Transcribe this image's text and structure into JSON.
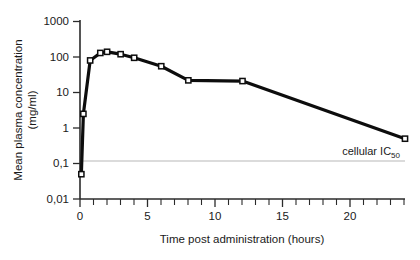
{
  "chart_data": {
    "type": "line",
    "title": "",
    "xlabel": "Time post administration (hours)",
    "ylabel_line1": "Mean plasma concentration",
    "ylabel_line2": "(mg/ml)",
    "yscale": "log",
    "xlim": [
      0,
      24
    ],
    "ylim": [
      0.01,
      1000
    ],
    "grid": false,
    "legend": "none",
    "x_ticklabels": [
      "0",
      "5",
      "10",
      "15",
      "20"
    ],
    "x_tickvalues": [
      0,
      5,
      10,
      15,
      20
    ],
    "x_minor_step": 1,
    "y_ticklabels": [
      "1000",
      "100",
      "10",
      "1",
      "0,1",
      "0,01"
    ],
    "y_tickvalues": [
      1000,
      100,
      10,
      1,
      0.1,
      0.01
    ],
    "x": [
      0.1,
      0.25,
      0.75,
      1.5,
      2,
      3,
      4,
      6,
      8,
      12,
      24
    ],
    "values": [
      0.05,
      2.5,
      80,
      130,
      140,
      120,
      95,
      55,
      22,
      21,
      0.5
    ],
    "marker": "open-square",
    "annotations": [
      {
        "name": "cellular-ic50",
        "text": "cellular IC",
        "subscript": "50",
        "y_value": 0.1,
        "line_from_x": 0,
        "line_to_x": 24
      }
    ]
  }
}
